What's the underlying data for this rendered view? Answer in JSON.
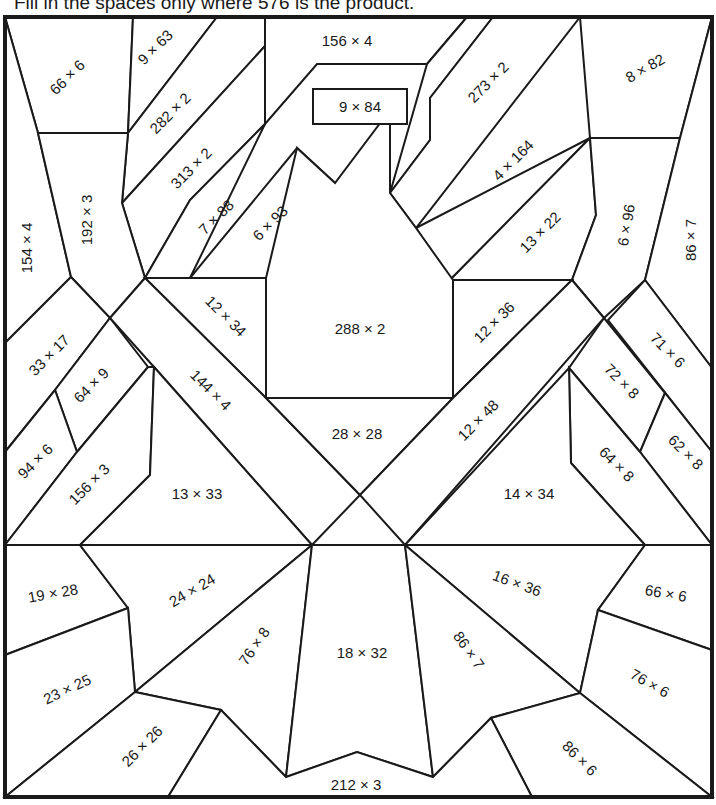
{
  "instruction": "Fill in the spaces only where 576 is the product.",
  "target_product": 576,
  "colors": {
    "ink": "#1a1a1a",
    "paper": "#ffffff"
  },
  "problems": [
    {
      "id": "p01",
      "label": "66 × 6",
      "x": 67,
      "y": 77,
      "rot": -45
    },
    {
      "id": "p02",
      "label": "9 × 63",
      "x": 155,
      "y": 47,
      "rot": -45
    },
    {
      "id": "p03",
      "label": "282 × 2",
      "x": 170,
      "y": 113,
      "rot": -45
    },
    {
      "id": "p04",
      "label": "156 × 4",
      "x": 347,
      "y": 40,
      "rot": 0
    },
    {
      "id": "p05",
      "label": "9 × 84",
      "x": 360,
      "y": 106,
      "rot": 0
    },
    {
      "id": "p06",
      "label": "273 × 2",
      "x": 488,
      "y": 82,
      "rot": -45
    },
    {
      "id": "p07",
      "label": "8 × 82",
      "x": 645,
      "y": 68,
      "rot": -30
    },
    {
      "id": "p08",
      "label": "313 × 2",
      "x": 191,
      "y": 168,
      "rot": -45
    },
    {
      "id": "p09",
      "label": "4 × 164",
      "x": 513,
      "y": 160,
      "rot": -45
    },
    {
      "id": "p10",
      "label": "154 × 4",
      "x": 26,
      "y": 248,
      "rot": -90
    },
    {
      "id": "p11",
      "label": "192 × 3",
      "x": 86,
      "y": 220,
      "rot": -90
    },
    {
      "id": "p12",
      "label": "7 × 88",
      "x": 216,
      "y": 217,
      "rot": -45
    },
    {
      "id": "p13",
      "label": "6 × 93",
      "x": 270,
      "y": 223,
      "rot": -45
    },
    {
      "id": "p14",
      "label": "13 × 22",
      "x": 540,
      "y": 232,
      "rot": -45
    },
    {
      "id": "p15",
      "label": "6 × 96",
      "x": 626,
      "y": 225,
      "rot": -80
    },
    {
      "id": "p16",
      "label": "86 × 7",
      "x": 690,
      "y": 240,
      "rot": -90
    },
    {
      "id": "p17",
      "label": "12 × 34",
      "x": 226,
      "y": 316,
      "rot": 45
    },
    {
      "id": "p18",
      "label": "288 × 2",
      "x": 360,
      "y": 328,
      "rot": 0
    },
    {
      "id": "p19",
      "label": "12 × 36",
      "x": 494,
      "y": 322,
      "rot": -45
    },
    {
      "id": "p20",
      "label": "33 × 17",
      "x": 49,
      "y": 355,
      "rot": -45
    },
    {
      "id": "p21",
      "label": "71 × 6",
      "x": 668,
      "y": 350,
      "rot": 45
    },
    {
      "id": "p22",
      "label": "64 × 9",
      "x": 91,
      "y": 385,
      "rot": -45
    },
    {
      "id": "p23",
      "label": "144 × 4",
      "x": 211,
      "y": 390,
      "rot": 45
    },
    {
      "id": "p24",
      "label": "72 × 8",
      "x": 622,
      "y": 381,
      "rot": 45
    },
    {
      "id": "p25",
      "label": "28 × 28",
      "x": 357,
      "y": 433,
      "rot": 0
    },
    {
      "id": "p26",
      "label": "12 × 48",
      "x": 478,
      "y": 420,
      "rot": -45
    },
    {
      "id": "p27",
      "label": "62 × 8",
      "x": 686,
      "y": 452,
      "rot": 45
    },
    {
      "id": "p28",
      "label": "94 × 6",
      "x": 35,
      "y": 461,
      "rot": -45
    },
    {
      "id": "p29",
      "label": "156 × 3",
      "x": 89,
      "y": 484,
      "rot": -45
    },
    {
      "id": "p30",
      "label": "64 × 8",
      "x": 617,
      "y": 464,
      "rot": 45
    },
    {
      "id": "p31",
      "label": "13 × 33",
      "x": 197,
      "y": 493,
      "rot": 0
    },
    {
      "id": "p32",
      "label": "14 × 34",
      "x": 529,
      "y": 493,
      "rot": 0
    },
    {
      "id": "p33",
      "label": "19 × 28",
      "x": 53,
      "y": 593,
      "rot": -10
    },
    {
      "id": "p34",
      "label": "24 × 24",
      "x": 192,
      "y": 590,
      "rot": -30
    },
    {
      "id": "p35",
      "label": "16 × 36",
      "x": 517,
      "y": 583,
      "rot": 20
    },
    {
      "id": "p36",
      "label": "66 × 6",
      "x": 666,
      "y": 593,
      "rot": 10
    },
    {
      "id": "p37",
      "label": "76 × 8",
      "x": 254,
      "y": 646,
      "rot": -55
    },
    {
      "id": "p38",
      "label": "18 × 32",
      "x": 362,
      "y": 652,
      "rot": 0
    },
    {
      "id": "p39",
      "label": "86 × 7",
      "x": 469,
      "y": 650,
      "rot": 55
    },
    {
      "id": "p40",
      "label": "23 × 25",
      "x": 67,
      "y": 689,
      "rot": -25
    },
    {
      "id": "p41",
      "label": "76 × 6",
      "x": 650,
      "y": 683,
      "rot": 30
    },
    {
      "id": "p42",
      "label": "26 × 26",
      "x": 142,
      "y": 746,
      "rot": -45
    },
    {
      "id": "p43",
      "label": "86 × 6",
      "x": 580,
      "y": 758,
      "rot": 45
    },
    {
      "id": "p44",
      "label": "212 × 3",
      "x": 356,
      "y": 784,
      "rot": 0
    }
  ]
}
